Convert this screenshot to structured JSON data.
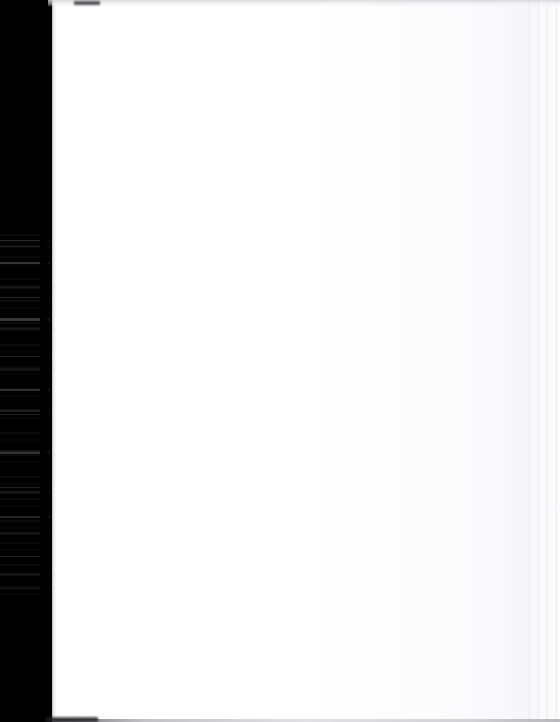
{
  "document": {
    "kind": "scanned-page",
    "page_text": "",
    "page_background_color": "#ffffff",
    "frame_background_color": "#000000"
  },
  "scan": {
    "width_px": 560,
    "height_px": 722,
    "gutter": {
      "name": "binding-gutter",
      "side": "left",
      "width_px": 52,
      "color": "#000000",
      "has_scanline_streaks": true,
      "streak_color": "#ffffff"
    },
    "page": {
      "left_px": 48,
      "width_px": 512,
      "color": "#ffffff",
      "tone_color": "#f8f8fa"
    },
    "artifacts": {
      "top_edge_band_color": "#d6d6da",
      "top_smudge_color": "#28282c",
      "bottom_edge_line_color": "#3c3c40",
      "right_striation_color": "#e6e6ec"
    }
  }
}
